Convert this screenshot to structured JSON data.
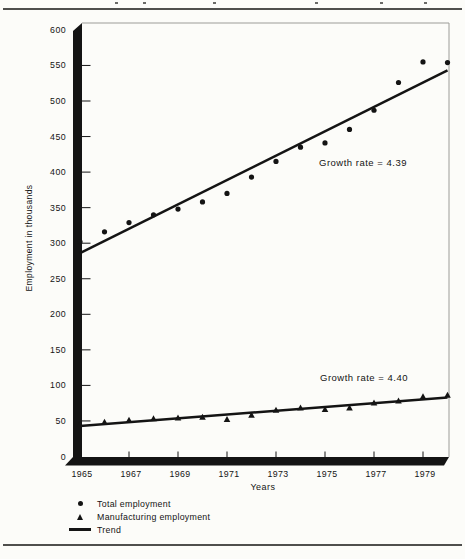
{
  "chart_data": {
    "type": "scatter",
    "title": "",
    "xlabel": "Years",
    "ylabel": "Employment in thousands",
    "xlim": [
      1965,
      1980
    ],
    "ylim": [
      0,
      600
    ],
    "y_tick_step": 50,
    "y_ticks": [
      0,
      50,
      100,
      150,
      200,
      250,
      300,
      350,
      400,
      450,
      500,
      550,
      600
    ],
    "x_tick_labels": [
      "1965",
      "1967",
      "1969",
      "1971",
      "1973",
      "1975",
      "1977",
      "1979"
    ],
    "grid": false,
    "x": [
      1965,
      1966,
      1967,
      1968,
      1969,
      1970,
      1971,
      1972,
      1973,
      1974,
      1975,
      1976,
      1977,
      1978,
      1979,
      1980
    ],
    "series": [
      {
        "name": "Total employment",
        "marker": "circle",
        "values": [
          302,
          316,
          329,
          340,
          348,
          358,
          370,
          393,
          415,
          435,
          441,
          460,
          487,
          526,
          555,
          554
        ]
      },
      {
        "name": "Manufacturing employment",
        "marker": "triangle",
        "values": [
          45,
          48,
          51,
          53,
          54,
          55,
          52,
          58,
          65,
          68,
          66,
          68,
          75,
          78,
          84,
          86
        ]
      }
    ],
    "trends": [
      {
        "series": "Total employment",
        "start_year": 1965,
        "start_value": 286,
        "end_year": 1980,
        "end_value": 543,
        "label": "Growth rate = 4.39"
      },
      {
        "series": "Manufacturing employment",
        "start_year": 1965,
        "start_value": 43,
        "end_year": 1980,
        "end_value": 83,
        "label": "Growth rate = 4.40"
      }
    ],
    "legend_entries": [
      {
        "marker": "circle",
        "label": "Total employment"
      },
      {
        "marker": "triangle",
        "label": "Manufacturing employment"
      },
      {
        "marker": "line",
        "label": "Trend"
      }
    ],
    "legend_position": "bottom-left",
    "colors": {
      "ink": "#141414",
      "frame": "#9c9c98",
      "rule": "#4f4f4d",
      "background": "#fcfcf9"
    }
  }
}
